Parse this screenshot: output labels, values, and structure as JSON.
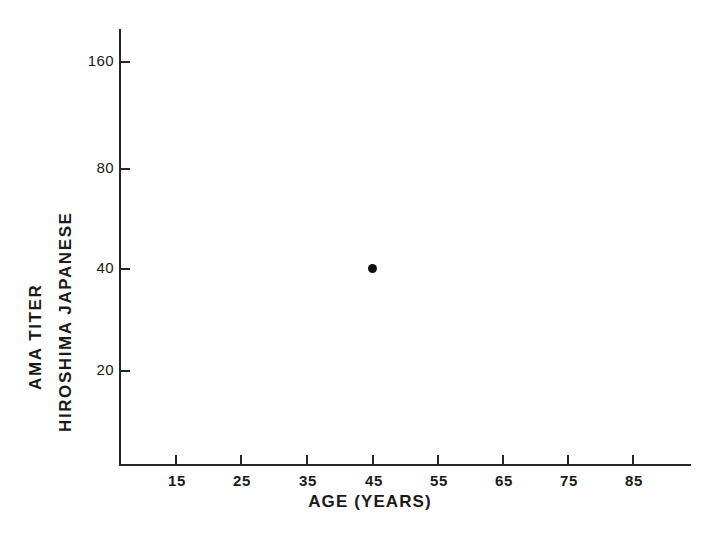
{
  "chart_data": {
    "type": "scatter",
    "title": "",
    "subtitle": "",
    "xlabel": "AGE (YEARS)",
    "ylabel_outer": "AMA TITER",
    "ylabel_inner": "HIROSHIMA JAPANESE",
    "ylabel_full": "AMA TITER HIROSHIMA JAPANESE",
    "x": [
      45
    ],
    "y": [
      40
    ],
    "points": [
      {
        "label": "",
        "x": 45,
        "y": 40
      }
    ],
    "series": [
      {
        "name": "Hiroshima Japanese",
        "marker": "filled-circle",
        "color": "#0d0d0d",
        "points": [
          {
            "x": 45,
            "y": 40
          }
        ]
      }
    ],
    "xticks": [
      15,
      25,
      35,
      45,
      55,
      65,
      75,
      85
    ],
    "xtick_labels": [
      "15",
      "25",
      "35",
      "45",
      "55",
      "65",
      "75",
      "85"
    ],
    "yticks": [
      20,
      40,
      80,
      160
    ],
    "ytick_labels": [
      "20",
      "40",
      "80",
      "160"
    ],
    "xlim": [
      10,
      92
    ],
    "ylim": [
      13,
      230
    ],
    "xscale": "linear",
    "yscale": "log2",
    "grid": false,
    "legend": false,
    "legend_position": "none",
    "background_color": "#ffffff",
    "ink_color": "#262626",
    "annotations": []
  },
  "figure": {
    "background_color": "#ffffff",
    "axis_color": "#262626",
    "marker_color": "#0d0d0d"
  }
}
